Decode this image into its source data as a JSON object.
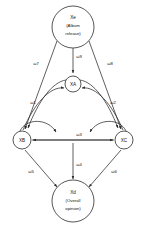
{
  "diagram": {
    "type": "directed-graph",
    "title": "",
    "nodes": [
      {
        "id": "Xe",
        "label": "Xe",
        "sublabel_line1": "(Album",
        "sublabel_line2": "release)",
        "full_label": "Xe (Album release)",
        "x": 73,
        "y": 27,
        "r": 21
      },
      {
        "id": "XA",
        "label": "XA",
        "sublabel_line1": "",
        "sublabel_line2": "",
        "full_label": "XA",
        "x": 73,
        "y": 84,
        "r": 8
      },
      {
        "id": "XB",
        "label": "XB",
        "sublabel_line1": "",
        "sublabel_line2": "",
        "full_label": "XB",
        "x": 22,
        "y": 140,
        "r": 9
      },
      {
        "id": "XC",
        "label": "XC",
        "sublabel_line1": "",
        "sublabel_line2": "",
        "full_label": "XC",
        "x": 124,
        "y": 140,
        "r": 9
      },
      {
        "id": "Xd",
        "label": "Xd",
        "sublabel_line1": "(Overall",
        "sublabel_line2": "opinion)",
        "full_label": "Xd (Overall opinion)",
        "x": 73,
        "y": 201,
        "r": 21
      }
    ],
    "edges": [
      {
        "id": "e7",
        "label": "ω7",
        "from": "Xe",
        "to": "XB",
        "label_x": 36,
        "label_y": 65
      },
      {
        "id": "e9",
        "label": "ω9",
        "from": "Xe",
        "to": "XA",
        "label_x": 79,
        "label_y": 58
      },
      {
        "id": "e8",
        "label": "ω8",
        "from": "Xe",
        "to": "XC",
        "label_x": 110,
        "label_y": 65
      },
      {
        "id": "e1",
        "label": "ω1",
        "from": "XA",
        "to": "XB",
        "bidirectional": true,
        "label_x": 33,
        "label_y": 104
      },
      {
        "id": "e2",
        "label": "ω2",
        "from": "XA",
        "to": "XC",
        "bidirectional": true,
        "label_x": 113,
        "label_y": 104
      },
      {
        "id": "e3",
        "label": "ω3",
        "from": "XB",
        "to": "XC",
        "bidirectional": true,
        "label_x": 79,
        "label_y": 136
      },
      {
        "id": "e5",
        "label": "ω5",
        "from": "XB",
        "to": "Xd",
        "label_x": 31,
        "label_y": 173
      },
      {
        "id": "e4",
        "label": "ω4",
        "from": "XA",
        "to": "Xd",
        "label_x": 79,
        "label_y": 166
      },
      {
        "id": "e6",
        "label": "ω6",
        "from": "XC",
        "to": "Xd",
        "label_x": 114,
        "label_y": 173
      }
    ],
    "colors": {
      "stroke": "#2b2b2b",
      "node_fill": "#ffffff",
      "text": "#111111",
      "background": "#ffffff"
    }
  }
}
